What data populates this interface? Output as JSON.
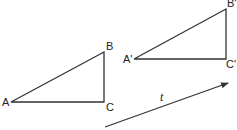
{
  "diagram": {
    "type": "translation",
    "stroke_color": "#333333",
    "original": {
      "name": "triangle-ABC",
      "vertices": {
        "A": {
          "label": "A",
          "x": 11,
          "y": 102
        },
        "B": {
          "label": "B",
          "x": 104,
          "y": 52
        },
        "C": {
          "label": "C",
          "x": 104,
          "y": 102
        }
      }
    },
    "image": {
      "name": "triangle-A'B'C'",
      "vertices": {
        "A": {
          "label": "A'",
          "x": 134,
          "y": 59
        },
        "B": {
          "label": "B'",
          "x": 226,
          "y": 9
        },
        "C": {
          "label": "C'",
          "x": 226,
          "y": 59
        }
      }
    },
    "vector": {
      "label": "t",
      "from": {
        "x": 105,
        "y": 127
      },
      "to": {
        "x": 228,
        "y": 83
      }
    }
  }
}
